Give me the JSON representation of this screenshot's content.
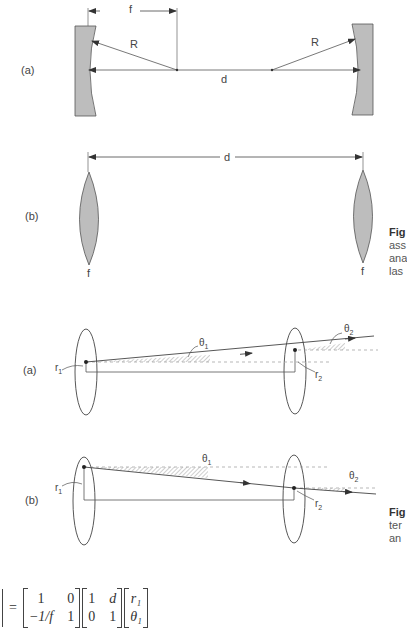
{
  "figure_top": {
    "panel_a": {
      "label": "(a)",
      "focal_label": "f",
      "radius_left_label": "R",
      "radius_right_label": "R",
      "distance_label": "d"
    },
    "panel_b": {
      "label": "(b)",
      "distance_label": "d",
      "lens_left_label": "f",
      "lens_right_label": "f"
    },
    "caption_fragment": [
      "Fig",
      "ass",
      "ana",
      "las"
    ]
  },
  "figure_bottom": {
    "panel_a": {
      "label": "(a)",
      "r1": "r",
      "r1_sub": "1",
      "r2": "r",
      "r2_sub": "2",
      "theta1": "θ",
      "theta1_sub": "1",
      "theta2": "θ",
      "theta2_sub": "2"
    },
    "panel_b": {
      "label": "(b)",
      "r1": "r",
      "r1_sub": "1",
      "r2": "r",
      "r2_sub": "2",
      "theta1": "θ",
      "theta1_sub": "1",
      "theta2": "θ",
      "theta2_sub": "2"
    },
    "caption_fragment": [
      "Fig",
      "ter",
      "an"
    ]
  },
  "equation": {
    "equals": "=",
    "matrix1": [
      "1",
      "0",
      "−1/f",
      "1"
    ],
    "matrix2": [
      "1",
      "d",
      "0",
      "1"
    ],
    "vector": [
      "r₁",
      "θ₁"
    ]
  }
}
